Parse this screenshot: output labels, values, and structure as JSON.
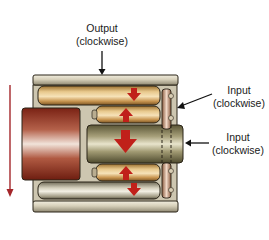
{
  "diagram": {
    "type": "planetary roller / gear mechanism cross-section",
    "labels": {
      "output": {
        "line1": "Output",
        "line2": "(clockwise)"
      },
      "input_upper": {
        "line1": "Input",
        "line2": "(clockwise)"
      },
      "input_lower": {
        "line1": "Input",
        "line2": "(clockwise)"
      }
    },
    "components": [
      {
        "name": "outer-housing",
        "color": "#c9c2ad"
      },
      {
        "name": "top-roller",
        "color": "#d7b27a",
        "arrow": "down"
      },
      {
        "name": "upper-inner-roller",
        "color": "#d9ad6a",
        "arrow": "up"
      },
      {
        "name": "central-shaft",
        "color": "#8e8763",
        "arrow": "down"
      },
      {
        "name": "lower-inner-roller",
        "color": "#d9ad6a",
        "arrow": "up"
      },
      {
        "name": "bottom-roller",
        "color": "#c2bca6",
        "arrow": "down"
      },
      {
        "name": "left-block",
        "color": "#8f2f1c"
      },
      {
        "name": "right-disc",
        "color": "#c89a7c"
      }
    ],
    "colors": {
      "arrow_red": "#c0201a",
      "motion_arrow": "#a4262a",
      "outline": "#2a2418"
    }
  }
}
